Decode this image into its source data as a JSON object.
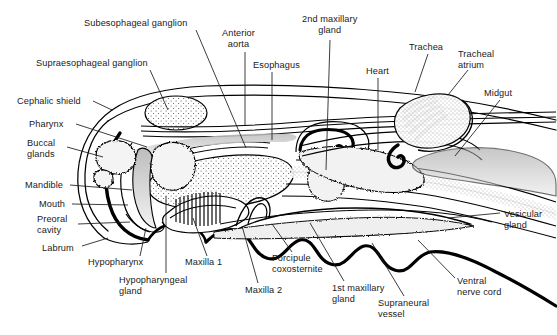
{
  "figure": {
    "type": "anatomical-line-diagram",
    "background_color": "#ffffff",
    "ink_color": "#000000",
    "label_color": "#1a1a1a",
    "stipple_color": "#3c3c3c",
    "width": 557,
    "height": 335
  },
  "labels": [
    {
      "id": "subesophageal-ganglion",
      "text": "Subesophageal ganglion",
      "x": 84,
      "y": 18,
      "align": "left",
      "leader": [
        [
          196,
          30
        ],
        [
          246,
          148
        ]
      ]
    },
    {
      "id": "anterior-aorta",
      "text": "Anterior\naorta",
      "x": 222,
      "y": 28,
      "align": "center",
      "leader": [
        [
          245,
          52
        ],
        [
          245,
          125
        ]
      ]
    },
    {
      "id": "2nd-maxillary-gland",
      "text": "2nd maxillary\ngland",
      "x": 302,
      "y": 14,
      "align": "center",
      "leader": [
        [
          330,
          40
        ],
        [
          326,
          170
        ]
      ]
    },
    {
      "id": "trachea",
      "text": "Trachea",
      "x": 409,
      "y": 42,
      "align": "left",
      "leader": [
        [
          428,
          54
        ],
        [
          415,
          92
        ]
      ]
    },
    {
      "id": "tracheal-atrium",
      "text": "Tracheal\natrium",
      "x": 458,
      "y": 49,
      "align": "left",
      "leader": [
        [
          468,
          70
        ],
        [
          448,
          95
        ]
      ]
    },
    {
      "id": "supraesophageal-ganglion",
      "text": "Supraesophageal ganglion",
      "x": 36,
      "y": 58,
      "align": "left",
      "leader": [
        [
          150,
          70
        ],
        [
          168,
          110
        ]
      ]
    },
    {
      "id": "esophagus",
      "text": "Esophagus",
      "x": 253,
      "y": 60,
      "align": "left",
      "leader": [
        [
          272,
          72
        ],
        [
          272,
          140
        ]
      ]
    },
    {
      "id": "heart",
      "text": "Heart",
      "x": 366,
      "y": 66,
      "align": "left",
      "leader": [
        [
          378,
          78
        ],
        [
          378,
          150
        ]
      ]
    },
    {
      "id": "midgut",
      "text": "Midgut",
      "x": 484,
      "y": 88,
      "align": "left",
      "leader": [
        [
          500,
          100
        ],
        [
          455,
          156
        ]
      ]
    },
    {
      "id": "cephalic-shield",
      "text": "Cephalic shield",
      "x": 17,
      "y": 96,
      "align": "left",
      "leader": [
        [
          93,
          101
        ],
        [
          112,
          110
        ]
      ]
    },
    {
      "id": "pharynx",
      "text": "Pharynx",
      "x": 29,
      "y": 119,
      "align": "left",
      "leader": [
        [
          76,
          124
        ],
        [
          147,
          147
        ]
      ]
    },
    {
      "id": "buccal-glands",
      "text": "Buccal\nglands",
      "x": 27,
      "y": 138,
      "align": "left",
      "leader": [
        [
          67,
          147
        ],
        [
          103,
          157
        ]
      ]
    },
    {
      "id": "mandible",
      "text": "Mandible",
      "x": 25,
      "y": 180,
      "align": "left",
      "leader": [
        [
          70,
          185
        ],
        [
          132,
          190
        ]
      ]
    },
    {
      "id": "mouth",
      "text": "Mouth",
      "x": 39,
      "y": 199,
      "align": "left",
      "leader": [
        [
          72,
          204
        ],
        [
          128,
          205
        ]
      ]
    },
    {
      "id": "preoral-cavity",
      "text": "Preoral\ncavity",
      "x": 37,
      "y": 214,
      "align": "left",
      "leader": [
        [
          78,
          224
        ],
        [
          130,
          222
        ]
      ]
    },
    {
      "id": "labrum",
      "text": "Labrum",
      "x": 42,
      "y": 243,
      "align": "left",
      "leader": [
        [
          82,
          246
        ],
        [
          108,
          238
        ]
      ]
    },
    {
      "id": "hypopharynx",
      "text": "Hypopharynx",
      "x": 88,
      "y": 257,
      "align": "left",
      "leader": [
        [
          140,
          256
        ],
        [
          146,
          228
        ]
      ]
    },
    {
      "id": "hypopharyngeal-gland",
      "text": "Hypopharyngeal\ngland",
      "x": 119,
      "y": 275,
      "align": "left",
      "leader": [
        [
          166,
          273
        ],
        [
          166,
          196
        ]
      ]
    },
    {
      "id": "maxilla-1",
      "text": "Maxilla 1",
      "x": 185,
      "y": 257,
      "align": "left",
      "leader": [
        [
          207,
          256
        ],
        [
          193,
          218
        ]
      ]
    },
    {
      "id": "forcipule-coxosternite",
      "text": "Forcipule\ncoxosternite",
      "x": 272,
      "y": 253,
      "align": "left",
      "leader": [
        [
          292,
          252
        ],
        [
          272,
          224
        ]
      ]
    },
    {
      "id": "maxilla-2",
      "text": "Maxilla 2",
      "x": 245,
      "y": 285,
      "align": "left",
      "leader": [
        [
          258,
          283
        ],
        [
          242,
          226
        ]
      ]
    },
    {
      "id": "1st-maxillary-gland",
      "text": "1st maxillary\ngland",
      "x": 332,
      "y": 283,
      "align": "left",
      "leader": [
        [
          344,
          281
        ],
        [
          310,
          223
        ]
      ]
    },
    {
      "id": "supraneural-vessel",
      "text": "Supraneural\nvessel",
      "x": 378,
      "y": 298,
      "align": "left",
      "leader": [
        [
          404,
          296
        ],
        [
          372,
          243
        ]
      ]
    },
    {
      "id": "ventral-nerve-cord",
      "text": "Ventral\nnerve cord",
      "x": 457,
      "y": 276,
      "align": "left",
      "leader": [
        [
          455,
          278
        ],
        [
          418,
          240
        ]
      ]
    },
    {
      "id": "vesicular-gland",
      "text": "Vesicular\ngland",
      "x": 504,
      "y": 209,
      "align": "left",
      "leader": [
        [
          500,
          213
        ],
        [
          448,
          218
        ]
      ]
    }
  ]
}
